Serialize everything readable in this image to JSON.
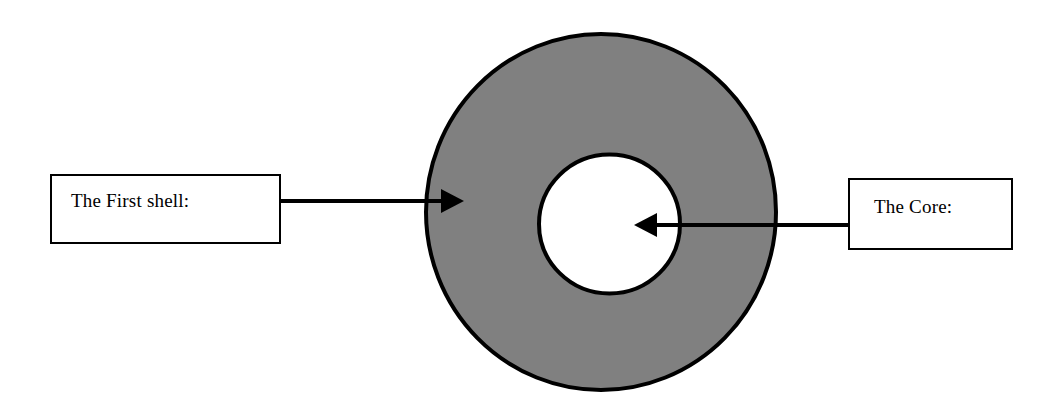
{
  "diagram": {
    "background_color": "#ffffff",
    "stroke_color": "#000000",
    "shell_fill_color": "#808080",
    "core_fill_color": "#ffffff",
    "shapes": {
      "outer_circle": {
        "name": "first-shell-ring",
        "cx": 601,
        "cy": 212,
        "rx": 177,
        "ry": 180,
        "fill": "#808080",
        "stroke_width": 4
      },
      "inner_circle": {
        "name": "core-circle",
        "cx": 609,
        "cy": 224,
        "rx": 72,
        "ry": 71,
        "fill": "#ffffff",
        "stroke_width": 4
      }
    },
    "arrows": [
      {
        "name": "shell-arrow",
        "direction": "right",
        "from_x": 281,
        "to_x": 464,
        "y": 201,
        "points_to": "first-shell-ring"
      },
      {
        "name": "core-arrow",
        "direction": "left",
        "from_x": 848,
        "to_x": 634,
        "y": 225,
        "points_to": "core-circle"
      }
    ]
  },
  "labels": {
    "shell": "The First shell:",
    "core": "The Core:"
  }
}
